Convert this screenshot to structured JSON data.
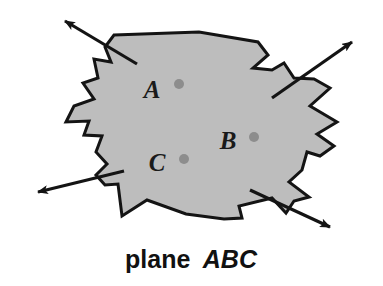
{
  "figure": {
    "kind": "geometry-diagram",
    "caption": {
      "prefix": "plane",
      "points_label": "ABC",
      "full_text": "plane ABC"
    },
    "colors": {
      "plane_fill": "#bdbdbd",
      "plane_stroke": "#141414",
      "point_dot": "#8d8d8d",
      "label_text": "#1a1a1a",
      "caption_text": "#111111",
      "background": "#ffffff"
    },
    "plane": {
      "name": "plane ABC",
      "stroke_width": 3,
      "outline_points": "114,35 199,32 258,42 268,55 253,68 272,70 284,63 294,78 314,79 330,88 310,106 337,122 317,134 334,146 320,156 307,152 302,170 289,182 309,197 294,201 286,213 272,198 239,206 242,218 224,219 186,214 147,200 122,216 118,184 105,185 96,175 107,164 96,152 102,136 84,135 89,121 66,122 74,106 94,99 83,83 98,78 94,59 111,62 105,47"
    },
    "points": [
      {
        "id": "A",
        "label": "A",
        "label_x": 152,
        "label_y": 98,
        "dot_x": 179,
        "dot_y": 84,
        "dot_r": 5
      },
      {
        "id": "B",
        "label": "B",
        "label_x": 228,
        "label_y": 149,
        "dot_x": 254,
        "dot_y": 137,
        "dot_r": 5
      },
      {
        "id": "C",
        "label": "C",
        "label_x": 157,
        "label_y": 171,
        "dot_x": 184,
        "dot_y": 159,
        "dot_r": 5
      }
    ],
    "arrows": [
      {
        "id": "upper-left",
        "name": "arrow-upper-left",
        "direction": "up-left",
        "x1": 137,
        "y1": 64,
        "x2": 65,
        "y2": 21,
        "head_at": "x2"
      },
      {
        "id": "upper-right",
        "name": "arrow-upper-right",
        "direction": "up-right",
        "x1": 272,
        "y1": 98,
        "x2": 352,
        "y2": 42,
        "head_at": "x2"
      },
      {
        "id": "lower-left",
        "name": "arrow-lower-left",
        "direction": "down-left",
        "x1": 124,
        "y1": 171,
        "x2": 38,
        "y2": 192,
        "head_at": "x2"
      },
      {
        "id": "lower-right",
        "name": "arrow-lower-right",
        "direction": "down-right",
        "x1": 250,
        "y1": 190,
        "x2": 330,
        "y2": 227,
        "head_at": "x2"
      }
    ],
    "caption_pos": {
      "x": 191,
      "y": 268
    }
  }
}
